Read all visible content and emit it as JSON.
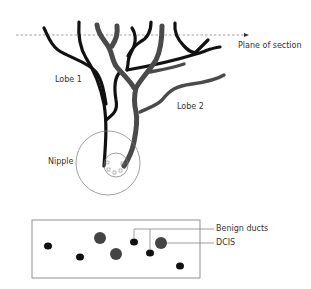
{
  "diagram": {
    "labels": {
      "plane_of_section": "Plane of section",
      "lobe1": "Lobe 1",
      "lobe2": "Lobe 2",
      "nipple": "Nipple",
      "benign_ducts": "Benign ducts",
      "dcis": "DCIS"
    },
    "colors": {
      "benign_duct": "#111111",
      "dcis_duct": "#4a4a4a",
      "outline": "#777777",
      "plane_line": "#888888"
    },
    "section_view": {
      "benign_ducts_count": 6,
      "dcis_ducts_count": 3
    }
  }
}
